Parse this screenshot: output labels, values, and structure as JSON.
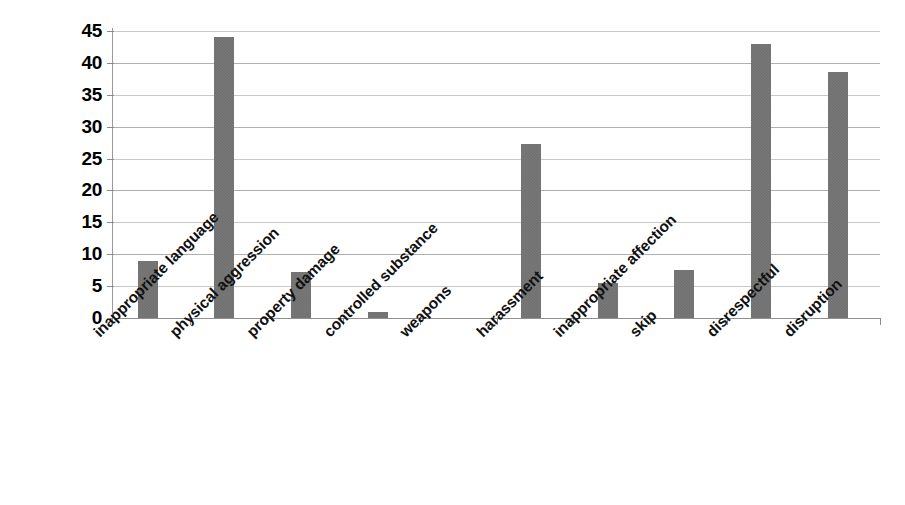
{
  "chart_data": {
    "type": "bar",
    "title": "",
    "subtitle": "",
    "xlabel": "",
    "ylabel": "",
    "ylim": [
      0,
      45
    ],
    "y_ticks": [
      0,
      5,
      10,
      15,
      20,
      25,
      30,
      35,
      40,
      45
    ],
    "grid": true,
    "legend": false,
    "legend_position": "none",
    "bar_color": "#6f6f6f",
    "categories": [
      "inappropriate language",
      "physical aggression",
      "property damage",
      "controlled substance",
      "weapons",
      "harassment",
      "inappropriate affection",
      "skip",
      "disrespectful",
      "disruption"
    ],
    "values": [
      9,
      44,
      7.2,
      1,
      0,
      27.3,
      5.5,
      7.5,
      43,
      38.5
    ]
  }
}
